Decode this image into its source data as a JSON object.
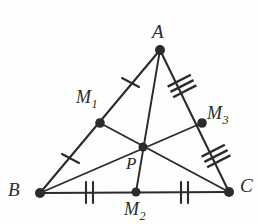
{
  "figure": {
    "width": 258,
    "height": 224,
    "background_color": "#fefefe",
    "stroke_color": "#2b2b2b",
    "point_color": "#2b2b2b"
  },
  "labels": {
    "A": "A",
    "B": "B",
    "C": "C",
    "P": "P",
    "M1_base": "M",
    "M1_sub": "1",
    "M2_base": "M",
    "M2_sub": "2",
    "M3_base": "M",
    "M3_sub": "3"
  },
  "points": [
    {
      "name": "A",
      "x": 160,
      "y": 50,
      "role": "vertex"
    },
    {
      "name": "B",
      "x": 40,
      "y": 193,
      "role": "vertex"
    },
    {
      "name": "C",
      "x": 229,
      "y": 192,
      "role": "vertex"
    },
    {
      "name": "M1",
      "x": 100,
      "y": 123,
      "role": "midpoint-of-AB"
    },
    {
      "name": "M2",
      "x": 136,
      "y": 192,
      "role": "midpoint-of-BC"
    },
    {
      "name": "M3",
      "x": 202,
      "y": 123,
      "role": "midpoint-of-AC"
    },
    {
      "name": "P",
      "x": 143,
      "y": 147,
      "role": "centroid"
    }
  ],
  "segments": [
    {
      "name": "side-AB",
      "from": "A",
      "to": "B"
    },
    {
      "name": "side-BC",
      "from": "B",
      "to": "C"
    },
    {
      "name": "side-AC",
      "from": "A",
      "to": "C"
    },
    {
      "name": "median-A-M2",
      "from": "A",
      "to": "M2"
    },
    {
      "name": "median-B-M3",
      "from": "B",
      "to": "M3"
    },
    {
      "name": "median-C-M1",
      "from": "C",
      "to": "M1"
    }
  ],
  "tick_marks": [
    {
      "name": "tick-A-M1",
      "segment": "A-M1",
      "count": 1,
      "x": 130,
      "y": 82
    },
    {
      "name": "tick-M1-B",
      "segment": "M1-B",
      "count": 1,
      "x": 70,
      "y": 158
    },
    {
      "name": "tick-B-M2",
      "segment": "B-M2",
      "count": 2,
      "x": 89,
      "y": 192
    },
    {
      "name": "tick-M2-C",
      "segment": "M2-C",
      "count": 2,
      "x": 184,
      "y": 192
    },
    {
      "name": "tick-A-M3",
      "segment": "A-M3",
      "count": 3,
      "x": 182,
      "y": 86
    },
    {
      "name": "tick-M3-C",
      "segment": "M3-C",
      "count": 3,
      "x": 216,
      "y": 156
    }
  ]
}
